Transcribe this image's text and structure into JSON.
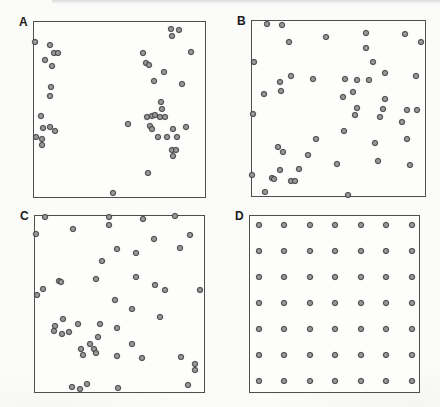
{
  "style": {
    "page_bg": "#fbfbfa",
    "box_border": "#4e4e4e",
    "dot_fill": "#9b9b9b",
    "dot_stroke": "#424242",
    "label_color": "#1a1a1a",
    "band_color": "#d4d4d4"
  },
  "chart_data": [
    {
      "type": "scatter",
      "title": "A",
      "pattern_note": "clumped point pattern",
      "units": "percent of panel, origin top-left",
      "points": [
        [
          0.6,
          11.3
        ],
        [
          9.2,
          13.0
        ],
        [
          6.4,
          21.5
        ],
        [
          11.6,
          17.5
        ],
        [
          13.9,
          17.5
        ],
        [
          10.4,
          24.9
        ],
        [
          9.8,
          37.3
        ],
        [
          9.2,
          42.4
        ],
        [
          4.0,
          53.7
        ],
        [
          5.2,
          60.5
        ],
        [
          9.2,
          59.9
        ],
        [
          12.1,
          62.1
        ],
        [
          1.2,
          65.5
        ],
        [
          4.6,
          66.7
        ],
        [
          4.6,
          70.1
        ],
        [
          80.3,
          4.0
        ],
        [
          85.0,
          4.5
        ],
        [
          80.9,
          7.9
        ],
        [
          91.9,
          16.9
        ],
        [
          63.6,
          17.5
        ],
        [
          65.3,
          23.2
        ],
        [
          67.1,
          24.3
        ],
        [
          76.3,
          28.8
        ],
        [
          69.9,
          33.9
        ],
        [
          86.7,
          35.6
        ],
        [
          74.0,
          45.8
        ],
        [
          74.6,
          49.7
        ],
        [
          65.9,
          54.2
        ],
        [
          68.8,
          53.7
        ],
        [
          70.5,
          53.1
        ],
        [
          73.4,
          54.2
        ],
        [
          76.9,
          54.2
        ],
        [
          54.9,
          58.2
        ],
        [
          67.6,
          59.3
        ],
        [
          68.8,
          61.0
        ],
        [
          72.3,
          65.5
        ],
        [
          78.0,
          65.5
        ],
        [
          81.5,
          61.0
        ],
        [
          83.8,
          65.5
        ],
        [
          89.0,
          59.9
        ],
        [
          80.9,
          72.9
        ],
        [
          83.2,
          73.4
        ],
        [
          81.5,
          76.3
        ],
        [
          66.5,
          86.4
        ],
        [
          46.2,
          97.7
        ]
      ]
    },
    {
      "type": "scatter",
      "title": "B",
      "pattern_note": "random point pattern",
      "units": "percent of panel, origin top-left",
      "points": [
        [
          8.6,
          1.7
        ],
        [
          17.1,
          2.3
        ],
        [
          21.1,
          11.9
        ],
        [
          42.9,
          9.0
        ],
        [
          65.7,
          6.8
        ],
        [
          88.6,
          7.3
        ],
        [
          97.7,
          11.9
        ],
        [
          65.7,
          15.3
        ],
        [
          1.1,
          23.2
        ],
        [
          69.7,
          23.2
        ],
        [
          77.1,
          29.9
        ],
        [
          94.9,
          31.6
        ],
        [
          22.3,
          31.6
        ],
        [
          35.4,
          33.3
        ],
        [
          53.7,
          33.3
        ],
        [
          60.6,
          33.9
        ],
        [
          67.4,
          33.9
        ],
        [
          16.0,
          35.0
        ],
        [
          16.6,
          40.1
        ],
        [
          6.9,
          41.8
        ],
        [
          58.3,
          40.7
        ],
        [
          52.6,
          43.5
        ],
        [
          76.6,
          44.6
        ],
        [
          60.6,
          49.7
        ],
        [
          76.0,
          50.3
        ],
        [
          89.7,
          50.8
        ],
        [
          95.4,
          50.8
        ],
        [
          0.6,
          53.1
        ],
        [
          59.4,
          53.7
        ],
        [
          73.7,
          54.8
        ],
        [
          86.9,
          57.6
        ],
        [
          53.1,
          62.7
        ],
        [
          89.7,
          67.2
        ],
        [
          37.1,
          67.2
        ],
        [
          70.9,
          69.5
        ],
        [
          14.9,
          71.8
        ],
        [
          17.7,
          74.6
        ],
        [
          32.6,
          76.3
        ],
        [
          73.1,
          80.2
        ],
        [
          49.1,
          81.9
        ],
        [
          91.4,
          82.5
        ],
        [
          27.4,
          84.7
        ],
        [
          16.0,
          85.3
        ],
        [
          0.0,
          88.1
        ],
        [
          11.4,
          89.8
        ],
        [
          12.6,
          90.4
        ],
        [
          22.3,
          91.5
        ],
        [
          25.1,
          91.5
        ],
        [
          7.4,
          97.7
        ],
        [
          55.4,
          99.5
        ]
      ]
    },
    {
      "type": "scatter",
      "title": "C",
      "pattern_note": "random point pattern",
      "units": "percent of panel, origin top-left",
      "points": [
        [
          5.8,
          0.6
        ],
        [
          43.6,
          0.6
        ],
        [
          64.0,
          1.7
        ],
        [
          82.6,
          0.0
        ],
        [
          0.6,
          10.1
        ],
        [
          22.7,
          7.3
        ],
        [
          43.6,
          5.1
        ],
        [
          70.3,
          12.9
        ],
        [
          91.9,
          10.7
        ],
        [
          86.0,
          18.0
        ],
        [
          48.8,
          18.5
        ],
        [
          59.9,
          20.8
        ],
        [
          39.5,
          25.3
        ],
        [
          36.0,
          36.0
        ],
        [
          59.9,
          34.8
        ],
        [
          14.0,
          37.1
        ],
        [
          15.1,
          37.6
        ],
        [
          4.7,
          41.6
        ],
        [
          1.2,
          44.9
        ],
        [
          70.9,
          39.3
        ],
        [
          76.7,
          42.1
        ],
        [
          97.7,
          42.1
        ],
        [
          47.1,
          47.8
        ],
        [
          57.6,
          52.8
        ],
        [
          73.8,
          57.3
        ],
        [
          16.3,
          58.4
        ],
        [
          11.6,
          62.4
        ],
        [
          25.6,
          61.2
        ],
        [
          38.4,
          61.2
        ],
        [
          11.0,
          65.2
        ],
        [
          15.7,
          66.9
        ],
        [
          20.3,
          65.7
        ],
        [
          48.3,
          63.5
        ],
        [
          37.2,
          68.5
        ],
        [
          32.6,
          72.5
        ],
        [
          34.9,
          75.3
        ],
        [
          57.6,
          73.0
        ],
        [
          27.3,
          75.3
        ],
        [
          28.5,
          78.7
        ],
        [
          36.0,
          78.1
        ],
        [
          48.8,
          79.8
        ],
        [
          63.4,
          80.9
        ],
        [
          86.6,
          80.3
        ],
        [
          94.8,
          84.3
        ],
        [
          94.8,
          87.6
        ],
        [
          22.1,
          97.2
        ],
        [
          26.7,
          98.3
        ],
        [
          30.8,
          95.5
        ],
        [
          49.4,
          97.8
        ],
        [
          90.7,
          96.1
        ]
      ]
    },
    {
      "type": "scatter",
      "title": "D",
      "pattern_note": "uniform 7x7 grid point pattern",
      "units": "percent of panel, origin top-left",
      "points": [
        [
          5.1,
          5.2
        ],
        [
          20.1,
          5.2
        ],
        [
          35.3,
          5.2
        ],
        [
          50.3,
          5.2
        ],
        [
          65.5,
          5.2
        ],
        [
          80.5,
          5.2
        ],
        [
          95.7,
          5.2
        ],
        [
          5.1,
          20.1
        ],
        [
          20.1,
          20.1
        ],
        [
          35.3,
          20.1
        ],
        [
          50.3,
          20.1
        ],
        [
          65.5,
          20.1
        ],
        [
          80.5,
          20.1
        ],
        [
          95.7,
          20.1
        ],
        [
          5.1,
          34.8
        ],
        [
          20.1,
          34.8
        ],
        [
          35.3,
          34.8
        ],
        [
          50.3,
          34.8
        ],
        [
          65.5,
          34.8
        ],
        [
          80.5,
          34.8
        ],
        [
          95.7,
          34.8
        ],
        [
          5.1,
          49.6
        ],
        [
          20.1,
          49.6
        ],
        [
          35.3,
          49.6
        ],
        [
          50.3,
          49.6
        ],
        [
          65.5,
          49.6
        ],
        [
          80.5,
          49.6
        ],
        [
          95.7,
          49.6
        ],
        [
          5.1,
          64.4
        ],
        [
          20.1,
          64.4
        ],
        [
          35.3,
          64.4
        ],
        [
          50.3,
          64.4
        ],
        [
          65.5,
          64.4
        ],
        [
          80.5,
          64.4
        ],
        [
          95.7,
          64.4
        ],
        [
          5.1,
          79.0
        ],
        [
          20.1,
          79.0
        ],
        [
          35.3,
          79.0
        ],
        [
          50.3,
          79.0
        ],
        [
          65.5,
          79.0
        ],
        [
          80.5,
          79.0
        ],
        [
          95.7,
          79.0
        ],
        [
          5.1,
          93.8
        ],
        [
          20.1,
          93.8
        ],
        [
          35.3,
          93.8
        ],
        [
          50.3,
          93.8
        ],
        [
          65.5,
          93.8
        ],
        [
          80.5,
          93.8
        ],
        [
          95.7,
          93.8
        ]
      ]
    }
  ]
}
